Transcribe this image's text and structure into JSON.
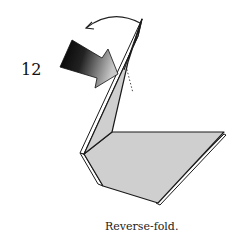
{
  "step": {
    "number": "12",
    "caption": "Reverse-fold."
  },
  "diagram": {
    "paper_color": "#cfcfcf",
    "edge_color": "#1a1a1a",
    "icons": [
      "push-arrow-icon",
      "curved-fold-arrow-icon",
      "fold-line-dotted"
    ]
  }
}
